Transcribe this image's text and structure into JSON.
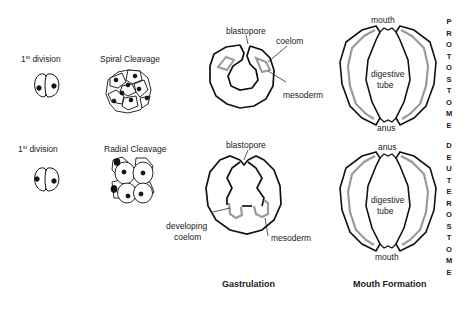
{
  "rows": {
    "protostome": {
      "first_division_label": "1",
      "first_division_sup": "st",
      "first_division_text": " division",
      "cleavage_label": "Spiral Cleavage",
      "gastrulation": {
        "blastopore_label": "blastopore",
        "coelom_label": "coelom",
        "mesoderm_label": "mesoderm"
      },
      "mouth_formation": {
        "top_label": "mouth",
        "center_label_line1": "digestive",
        "center_label_line2": "tube",
        "bottom_label": "anus"
      },
      "group_name_letters": [
        "P",
        "R",
        "O",
        "T",
        "O",
        "S",
        "T",
        "O",
        "M",
        "E"
      ]
    },
    "deuterostome": {
      "first_division_label": "1",
      "first_division_sup": "st",
      "first_division_text": " division",
      "cleavage_label": "Radial Cleavage",
      "gastrulation": {
        "blastopore_label": "blastopore",
        "developing_coelom_line1": "developing",
        "developing_coelom_line2": "coelom",
        "mesoderm_label": "mesoderm"
      },
      "mouth_formation": {
        "top_label": "anus",
        "center_label_line1": "digestive",
        "center_label_line2": "tube",
        "bottom_label": "mouth"
      },
      "group_name_letters": [
        "D",
        "E",
        "U",
        "T",
        "E",
        "R",
        "O",
        "S",
        "T",
        "O",
        "M",
        "E"
      ]
    }
  },
  "column_titles": {
    "gastrulation": "Gastrulation",
    "mouth_formation": "Mouth Formation"
  },
  "colors": {
    "outline": "#111111",
    "mesoderm_gray": "#9a9a9a",
    "nucleus": "#111111",
    "background": "#ffffff"
  }
}
